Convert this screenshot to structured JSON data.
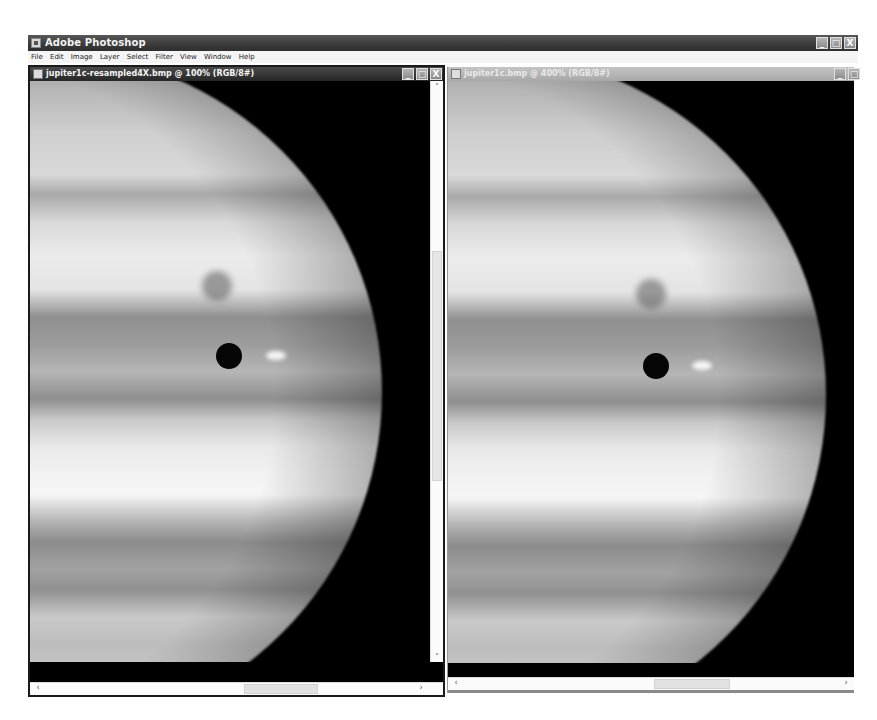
{
  "app": {
    "title": "Adobe Photoshop",
    "window_controls": {
      "minimize": "_",
      "maximize": "□",
      "close": "X"
    },
    "menu": [
      "File",
      "Edit",
      "Image",
      "Layer",
      "Select",
      "Filter",
      "View",
      "Window",
      "Help"
    ]
  },
  "documents": [
    {
      "title": "jupiter1c-resampled4X.bmp @ 100% (RGB/8#)",
      "active": true,
      "zoom": "100%",
      "mode": "RGB/8#",
      "controls": {
        "minimize": "_",
        "maximize": "□",
        "close": "X"
      },
      "scroll": {
        "up": "˄",
        "down": "˅",
        "left": "‹",
        "right": "›"
      }
    },
    {
      "title": "jupiter1c.bmp @ 400% (RGB/8#)",
      "active": false,
      "zoom": "400%",
      "mode": "RGB/8#",
      "controls": {
        "minimize": "_",
        "maximize": "□"
      },
      "scroll": {
        "left": "‹",
        "right": "›"
      }
    }
  ],
  "colors": {
    "app_titlebar": "#3a3a3a",
    "active_doc_titlebar": "#262626",
    "inactive_doc_titlebar": "#b0b0b0",
    "canvas_background": "#000000"
  }
}
